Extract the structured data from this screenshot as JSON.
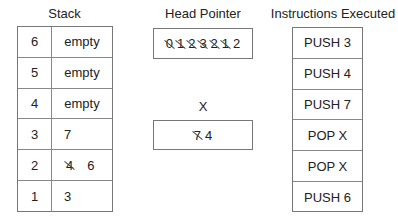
{
  "stack": {
    "title": "Stack",
    "rows": [
      {
        "index": "6",
        "value": "empty",
        "struck": ""
      },
      {
        "index": "5",
        "value": "empty",
        "struck": ""
      },
      {
        "index": "4",
        "value": "empty",
        "struck": ""
      },
      {
        "index": "3",
        "value": "7",
        "struck": ""
      },
      {
        "index": "2",
        "value": "6",
        "struck": "4"
      },
      {
        "index": "1",
        "value": "3",
        "struck": ""
      }
    ]
  },
  "head_pointer": {
    "title": "Head Pointer",
    "struck_values": [
      "0",
      "1",
      "2",
      "3",
      "2",
      "1"
    ],
    "current": "2"
  },
  "x_register": {
    "title": "X",
    "struck_value": "7",
    "current": "4"
  },
  "instructions": {
    "title": "Instructions Executed",
    "items": [
      "PUSH 3",
      "PUSH 4",
      "PUSH 7",
      "POP X",
      "POP X",
      "PUSH 6"
    ]
  }
}
